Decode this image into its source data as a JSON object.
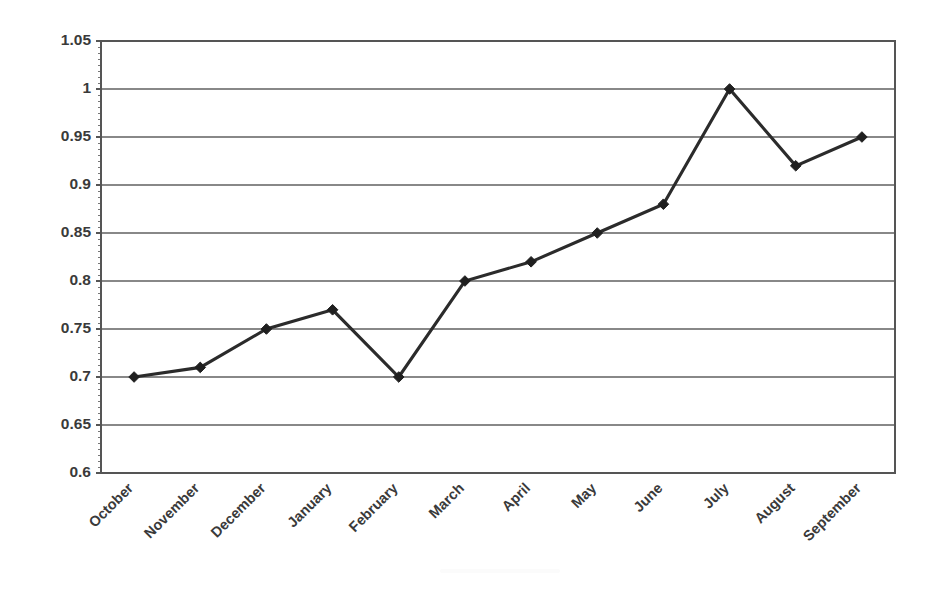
{
  "chart_data": {
    "type": "line",
    "title": "",
    "subtitle": "",
    "xlabel": "",
    "ylabel": "",
    "categories": [
      "October",
      "November",
      "December",
      "January",
      "February",
      "March",
      "April",
      "May",
      "June",
      "July",
      "August",
      "September"
    ],
    "values": [
      0.7,
      0.71,
      0.75,
      0.77,
      0.7,
      0.8,
      0.82,
      0.85,
      0.88,
      1.0,
      0.92,
      0.95
    ],
    "series": [
      {
        "name": "",
        "values": [
          0.7,
          0.71,
          0.75,
          0.77,
          0.7,
          0.8,
          0.82,
          0.85,
          0.88,
          1.0,
          0.92,
          0.95
        ]
      }
    ],
    "ylim": [
      0.6,
      1.05
    ],
    "ytick_labels": [
      "1.05",
      "1",
      "0.95",
      "0.9",
      "0.85",
      "0.8",
      "0.75",
      "0.7",
      "0.65",
      "0.6"
    ],
    "ytick_values": [
      1.05,
      1.0,
      0.95,
      0.9,
      0.85,
      0.8,
      0.75,
      0.7,
      0.65,
      0.6
    ],
    "grid": true,
    "grid_axis": "y",
    "legend": false,
    "legend_position": "none",
    "marker": "diamond",
    "annotations": [],
    "colors": {
      "line": "#2b2b2b",
      "marker": "#1f1f1f",
      "grid": "#888888",
      "axis": "#555555",
      "text": "#3a3a3a",
      "background": "#ffffff"
    },
    "xtick_rotation": -45
  },
  "axes": {
    "plot_left": 101,
    "plot_right": 895,
    "plot_top": 41,
    "plot_bottom": 473
  }
}
